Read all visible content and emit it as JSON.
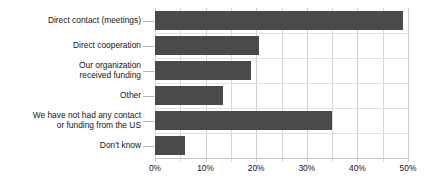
{
  "chart_data": {
    "type": "bar",
    "orientation": "horizontal",
    "title": "",
    "xlabel": "",
    "ylabel": "",
    "xlim": [
      0,
      50
    ],
    "grid": true,
    "legend": null,
    "tick_suffix": "%",
    "major_ticks": [
      0,
      10,
      20,
      30,
      40,
      50
    ],
    "minor_ticks": [
      5,
      15,
      25,
      35,
      45
    ],
    "tick_labels": [
      "0%",
      "10%",
      "20%",
      "30%",
      "40%",
      "50%"
    ],
    "bar_color": "#4a4a4a",
    "grid_color": "#d8d8d8",
    "categories": [
      "Direct contact (meetings)",
      "Direct cooperation",
      "Our organization\nreceived funding",
      "Other",
      "We have not had any contact\nor funding from the US",
      "Don't know"
    ],
    "values": [
      49,
      20.5,
      19,
      13.5,
      35,
      6
    ]
  }
}
